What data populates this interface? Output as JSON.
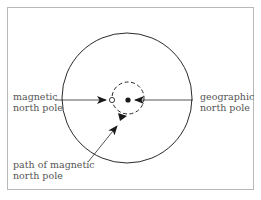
{
  "diagram": {
    "labels": {
      "magnetic_pole": [
        "magnetic",
        "north pole"
      ],
      "geographic_pole": [
        "geographic",
        "north pole"
      ],
      "path": [
        "path of magnetic",
        "north pole"
      ]
    },
    "colors": {
      "stroke": "#2a2a2a",
      "frame": "#b8b8b8",
      "text": "#555555"
    },
    "elements": {
      "outer_circle": "Earth outline (solid circle)",
      "inner_circle": "path of magnetic north pole (dashed circle)",
      "magnetic_marker": "open circle",
      "geographic_marker": "filled dot"
    }
  }
}
